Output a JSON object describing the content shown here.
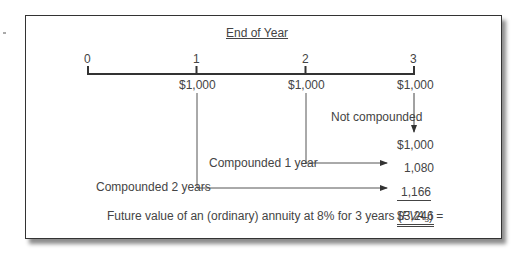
{
  "diagram": {
    "title": "End of Year",
    "timeline": {
      "periods": [
        "0",
        "1",
        "2",
        "3"
      ],
      "payments": [
        "$1,000",
        "$1,000",
        "$1,000"
      ]
    },
    "flows": [
      {
        "label": "Not compounded",
        "value": "$1,000"
      },
      {
        "label": "Compounded 1 year",
        "value": "1,080"
      },
      {
        "label": "Compounded 2 years",
        "value": "1,166"
      }
    ],
    "summary": {
      "prefix": "Future value of an (ordinary) annuity at 8% for 3 years (",
      "symbol": "FVA",
      "subscript": "3",
      "suffix": ") =",
      "total": "$3,246"
    }
  }
}
